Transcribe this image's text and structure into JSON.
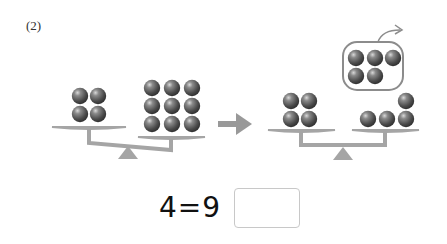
{
  "problem": {
    "number_label": "(2)",
    "equation_text": "4=9",
    "answer_value": ""
  },
  "scene": {
    "before": {
      "left_pan_count": 4,
      "right_pan_count": 9,
      "state": "tilted-right"
    },
    "after": {
      "left_pan_count": 4,
      "right_pan_count": 4,
      "removed_count": 5,
      "state": "balanced"
    }
  },
  "colors": {
    "scale": "#a5a5a5",
    "ball": "#555555",
    "outline": "#8c8c8c"
  }
}
